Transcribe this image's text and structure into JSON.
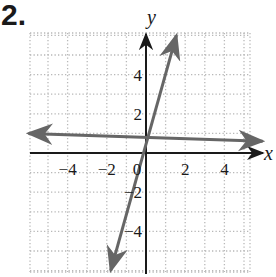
{
  "problem": {
    "number": "2."
  },
  "chart_data": {
    "type": "line",
    "title": "",
    "xlabel": "x",
    "ylabel": "y",
    "xlim": [
      -6,
      5.5
    ],
    "ylim": [
      -6.1,
      6.1
    ],
    "grid": true,
    "grid_style": "dotted",
    "x_ticks": [
      -4,
      -2,
      0,
      2,
      4
    ],
    "x_tick_labels": [
      "−4",
      "−2",
      "0",
      "2",
      "4"
    ],
    "y_ticks": [
      -4,
      -2,
      2,
      4
    ],
    "y_tick_labels": [
      "−4",
      "−2",
      "2",
      "4"
    ],
    "legend": null,
    "series": [
      {
        "name": "steep line through origin",
        "style": "solid gray with arrows at both ends",
        "x": [
          -1.8,
          0,
          1.55
        ],
        "y": [
          -6.0,
          0,
          6.0
        ]
      },
      {
        "name": "nearly horizontal line",
        "style": "solid gray with arrows at both ends",
        "x": [
          -6.0,
          0,
          5.95
        ],
        "y": [
          1.0,
          0.8,
          0.6
        ]
      }
    ]
  },
  "colors": {
    "axes": "#1a1a1a",
    "lines": "#666666",
    "grid": "#b8b8b8"
  }
}
